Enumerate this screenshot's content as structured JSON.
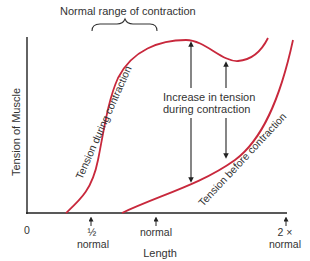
{
  "diagram": {
    "title": "Normal range of contraction",
    "y_axis_label": "Tension of Muscle",
    "x_axis_label": "Length",
    "x_ticks": [
      {
        "label_top": "0",
        "label_bottom": ""
      },
      {
        "label_top": "½",
        "label_bottom": "normal"
      },
      {
        "label_top": "normal",
        "label_bottom": ""
      },
      {
        "label_top": "2 ×",
        "label_bottom": "normal"
      }
    ],
    "curves": {
      "during": {
        "label": "Tension during contraction",
        "color": "#c8283c"
      },
      "before": {
        "label": "Tension before contraction",
        "color": "#c8283c"
      }
    },
    "annotation": {
      "line1": "Increase in tension",
      "line2": "during contraction"
    },
    "axis_color": "#222222"
  }
}
